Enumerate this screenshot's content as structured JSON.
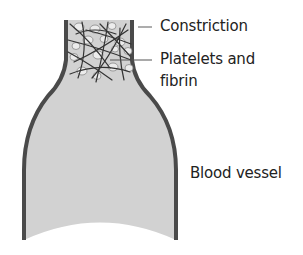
{
  "labels": {
    "constriction": "Constriction",
    "platelets_line1": "Platelets and",
    "platelets_line2": "fibrin",
    "blood_vessel": "Blood vessel"
  },
  "colors": {
    "wall": "#4a4a4a",
    "lumen": "#d2d2d2",
    "fibrin": "#333333",
    "platelet": "#ececec",
    "text": "#222222"
  }
}
